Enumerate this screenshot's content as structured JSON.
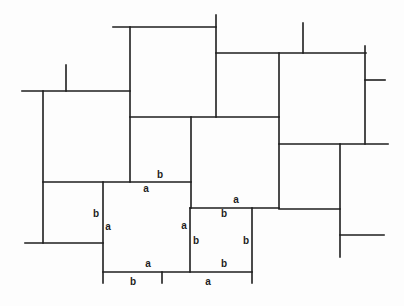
{
  "diagram": {
    "type": "tiling",
    "stroke_color": "#1e1e1e",
    "background": "#ffffff",
    "segments": [
      {
        "x1": 113,
        "y1": 27,
        "x2": 216,
        "y2": 27
      },
      {
        "x1": 130,
        "y1": 27,
        "x2": 130,
        "y2": 182
      },
      {
        "x1": 22,
        "y1": 91,
        "x2": 130,
        "y2": 91
      },
      {
        "x1": 66,
        "y1": 65,
        "x2": 66,
        "y2": 91
      },
      {
        "x1": 43,
        "y1": 91,
        "x2": 43,
        "y2": 243
      },
      {
        "x1": 25,
        "y1": 243,
        "x2": 103,
        "y2": 243
      },
      {
        "x1": 43,
        "y1": 182,
        "x2": 191,
        "y2": 182
      },
      {
        "x1": 130,
        "y1": 117,
        "x2": 279,
        "y2": 117
      },
      {
        "x1": 216,
        "y1": 15,
        "x2": 216,
        "y2": 117
      },
      {
        "x1": 216,
        "y1": 53,
        "x2": 366,
        "y2": 53
      },
      {
        "x1": 303,
        "y1": 23,
        "x2": 303,
        "y2": 53
      },
      {
        "x1": 279,
        "y1": 53,
        "x2": 279,
        "y2": 208
      },
      {
        "x1": 365,
        "y1": 46,
        "x2": 365,
        "y2": 144
      },
      {
        "x1": 365,
        "y1": 80,
        "x2": 385,
        "y2": 80
      },
      {
        "x1": 279,
        "y1": 144,
        "x2": 388,
        "y2": 144
      },
      {
        "x1": 340,
        "y1": 144,
        "x2": 340,
        "y2": 257
      },
      {
        "x1": 279,
        "y1": 209,
        "x2": 340,
        "y2": 209
      },
      {
        "x1": 340,
        "y1": 235,
        "x2": 384,
        "y2": 235
      },
      {
        "x1": 191,
        "y1": 117,
        "x2": 191,
        "y2": 208
      },
      {
        "x1": 190,
        "y1": 208,
        "x2": 279,
        "y2": 208
      },
      {
        "x1": 103,
        "y1": 182,
        "x2": 103,
        "y2": 283
      },
      {
        "x1": 190,
        "y1": 208,
        "x2": 190,
        "y2": 272
      },
      {
        "x1": 252,
        "y1": 208,
        "x2": 252,
        "y2": 283
      },
      {
        "x1": 103,
        "y1": 272,
        "x2": 252,
        "y2": 272
      },
      {
        "x1": 162,
        "y1": 272,
        "x2": 162,
        "y2": 283
      }
    ],
    "labels": [
      {
        "text": "b",
        "x": 160,
        "y": 175
      },
      {
        "text": "a",
        "x": 146,
        "y": 189
      },
      {
        "text": "b",
        "x": 96,
        "y": 214
      },
      {
        "text": "a",
        "x": 108,
        "y": 227
      },
      {
        "text": "a",
        "x": 184,
        "y": 226
      },
      {
        "text": "a",
        "x": 236,
        "y": 200
      },
      {
        "text": "b",
        "x": 224,
        "y": 214
      },
      {
        "text": "b",
        "x": 196,
        "y": 241
      },
      {
        "text": "b",
        "x": 246,
        "y": 241
      },
      {
        "text": "a",
        "x": 148,
        "y": 264
      },
      {
        "text": "b",
        "x": 224,
        "y": 264
      },
      {
        "text": "b",
        "x": 133,
        "y": 282
      },
      {
        "text": "a",
        "x": 208,
        "y": 282
      }
    ]
  }
}
